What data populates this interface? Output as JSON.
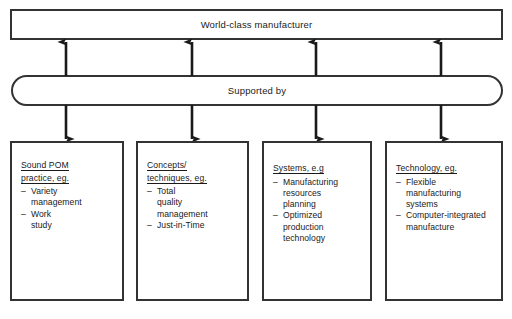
{
  "diagram": {
    "top": {
      "label": "World-class manufacturer"
    },
    "connector": {
      "label": "Supported by"
    },
    "arrow_color": "#1a1a1a",
    "border_color": "#333333",
    "background_color": "#ffffff",
    "pillars": [
      {
        "heading_lines": [
          "Sound POM",
          "practice, eg."
        ],
        "items": [
          "Variety\nmanagement",
          "Work\nstudy"
        ]
      },
      {
        "heading_lines": [
          "Concepts/",
          "techniques, eg."
        ],
        "items": [
          "Total\nquality\nmanagement",
          "Just-in-Time"
        ]
      },
      {
        "heading_lines": [
          "Systems, e.g"
        ],
        "items": [
          "Manufacturing\nresources\nplanning",
          "Optimized\nproduction\ntechnology"
        ]
      },
      {
        "heading_lines": [
          "Technology, eg."
        ],
        "items": [
          "Flexible\nmanufacturing\nsystems",
          "Computer-integrated\nmanufacture"
        ]
      }
    ],
    "dash_glyph": "–"
  }
}
